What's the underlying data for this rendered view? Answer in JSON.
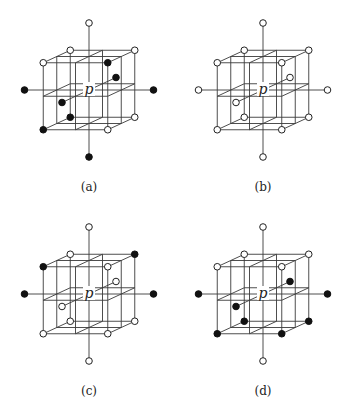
{
  "figure": {
    "center_label": "p",
    "colors": {
      "line": "#3a3a3a",
      "filled": "#111111",
      "open_fill": "#ffffff",
      "open_stroke": "#222222"
    },
    "geometry": {
      "center": [
        89,
        90
      ],
      "x_unit": [
        32.25,
        0
      ],
      "y_unit": [
        0,
        -33.5
      ],
      "z_unit": [
        13.5,
        -6.25
      ],
      "point_radius": 3.3
    },
    "points_legend": {
      "axis": [
        "-2,0,0",
        "2,0,0",
        "0,2,0",
        "0,-2,0",
        "0,0,2",
        "0,0,-2"
      ],
      "corners": [
        "-1,1,1",
        "1,1,1",
        "-1,1,-1",
        "1,1,-1",
        "-1,-1,1",
        "1,-1,1",
        "-1,-1,-1",
        "1,-1,-1"
      ]
    },
    "panels": [
      {
        "caption": "(a)",
        "offset": [
          0,
          0
        ],
        "filled": [
          "-2,0,0",
          "2,0,0",
          "0,-2,0",
          "1,1,-1",
          "0,0,2",
          "0,0,-2",
          "-1,-1,1",
          "-1,-1,-1"
        ]
      },
      {
        "caption": "(b)",
        "offset": [
          174,
          0
        ],
        "filled": []
      },
      {
        "caption": "(c)",
        "offset": [
          0,
          204
        ],
        "filled": [
          "-2,0,0",
          "2,0,0",
          "1,1,1",
          "-1,1,-1"
        ]
      },
      {
        "caption": "(d)",
        "offset": [
          174,
          204
        ],
        "filled": [
          "-2,0,0",
          "2,0,0",
          "0,0,2",
          "0,0,-2",
          "-1,-1,1",
          "1,-1,1",
          "-1,-1,-1",
          "1,-1,-1"
        ]
      }
    ]
  }
}
